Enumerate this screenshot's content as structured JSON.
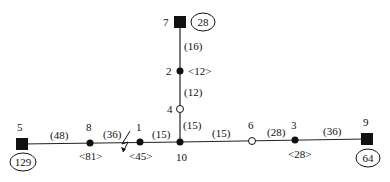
{
  "diagram": {
    "nodes": [
      {
        "id": "7",
        "label": "7",
        "type": "source",
        "badge": "28"
      },
      {
        "id": "2",
        "label": "2",
        "type": "load",
        "load": "<12>"
      },
      {
        "id": "4",
        "label": "4",
        "type": "open"
      },
      {
        "id": "10",
        "label": "10",
        "type": "load"
      },
      {
        "id": "1",
        "label": "1",
        "type": "load",
        "load": "<45>"
      },
      {
        "id": "8",
        "label": "8",
        "type": "load",
        "load": "<81>"
      },
      {
        "id": "5",
        "label": "5",
        "type": "source",
        "badge": "129"
      },
      {
        "id": "6",
        "label": "6",
        "type": "open"
      },
      {
        "id": "3",
        "label": "3",
        "type": "load",
        "load": "<28>"
      },
      {
        "id": "9",
        "label": "9",
        "type": "source",
        "badge": "64"
      }
    ],
    "edges": [
      {
        "from": "7",
        "to": "2",
        "weight": "(16)"
      },
      {
        "from": "2",
        "to": "4",
        "weight": "(12)"
      },
      {
        "from": "4",
        "to": "10",
        "weight": "(15)"
      },
      {
        "from": "5",
        "to": "8",
        "weight": "(48)"
      },
      {
        "from": "8",
        "to": "1",
        "weight": "(36)",
        "fault": true
      },
      {
        "from": "1",
        "to": "10",
        "weight": "(15)"
      },
      {
        "from": "10",
        "to": "6",
        "weight": "(15)"
      },
      {
        "from": "6",
        "to": "3",
        "weight": "(28)"
      },
      {
        "from": "3",
        "to": "9",
        "weight": "(36)"
      }
    ]
  }
}
